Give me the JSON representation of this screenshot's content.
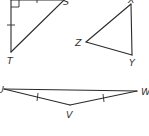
{
  "figure": {
    "type": "geometry-triangles",
    "colors": {
      "stroke": "#2a2a2a",
      "label": "#333333",
      "background": "#ffffff"
    },
    "triangles": [
      {
        "name": "right-triangle",
        "vertex_labels": [
          "S",
          "T",
          "R"
        ],
        "visible_labels": {
          "top": "S",
          "bottom": "T"
        },
        "right_angle_mark": true,
        "congruent_leg_ticks": 2
      },
      {
        "name": "triangle-xyz",
        "vertex_labels": [
          "X",
          "Y",
          "Z"
        ],
        "visible_labels": {
          "top": "X",
          "left": "Z",
          "bottom": "Y"
        }
      },
      {
        "name": "triangle-uvw",
        "vertex_labels": [
          "U",
          "V",
          "W"
        ],
        "visible_labels": {
          "left": "U",
          "bottom": "V",
          "right": "W"
        },
        "congruent_side_ticks": 2
      }
    ]
  }
}
